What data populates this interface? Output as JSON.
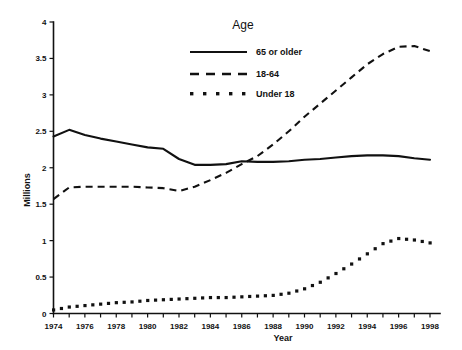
{
  "chart_data": {
    "type": "line",
    "title": "",
    "xlabel": "Year",
    "ylabel": "Millions",
    "xlim": [
      1974,
      1998
    ],
    "ylim": [
      0,
      4
    ],
    "ytick_labels": [
      "0",
      "0.5",
      "1",
      "1.5",
      "2",
      "2.5",
      "3",
      "3.5",
      "4"
    ],
    "ytick_values": [
      0,
      0.5,
      1,
      1.5,
      2,
      2.5,
      3,
      3.5,
      4
    ],
    "xtick_labels": [
      "1974",
      "1976",
      "1978",
      "1980",
      "1982",
      "1984",
      "1986",
      "1988",
      "1990",
      "1992",
      "1994",
      "1996",
      "1998"
    ],
    "xtick_values": [
      1974,
      1976,
      1978,
      1980,
      1982,
      1984,
      1986,
      1988,
      1990,
      1992,
      1994,
      1996,
      1998
    ],
    "grid": false,
    "legend_position": "top-center",
    "legend_title": "Age",
    "x": [
      1974,
      1975,
      1976,
      1977,
      1978,
      1979,
      1980,
      1981,
      1982,
      1983,
      1984,
      1985,
      1986,
      1987,
      1988,
      1989,
      1990,
      1991,
      1992,
      1993,
      1994,
      1995,
      1996,
      1997,
      1998
    ],
    "series": [
      {
        "name": "65 or older",
        "style": "solid",
        "values": [
          2.43,
          2.52,
          2.45,
          2.4,
          2.36,
          2.32,
          2.28,
          2.26,
          2.12,
          2.04,
          2.04,
          2.05,
          2.09,
          2.08,
          2.08,
          2.09,
          2.11,
          2.12,
          2.14,
          2.16,
          2.17,
          2.17,
          2.16,
          2.13,
          2.11
        ]
      },
      {
        "name": "18-64",
        "style": "dashed",
        "values": [
          1.57,
          1.73,
          1.74,
          1.74,
          1.74,
          1.74,
          1.73,
          1.72,
          1.68,
          1.74,
          1.83,
          1.93,
          2.05,
          2.16,
          2.32,
          2.5,
          2.7,
          2.88,
          3.06,
          3.24,
          3.42,
          3.56,
          3.66,
          3.67,
          3.6
        ]
      },
      {
        "name": "Under 18",
        "style": "dotted",
        "values": [
          0.05,
          0.09,
          0.11,
          0.13,
          0.15,
          0.16,
          0.18,
          0.19,
          0.2,
          0.21,
          0.22,
          0.22,
          0.23,
          0.24,
          0.25,
          0.28,
          0.34,
          0.43,
          0.55,
          0.68,
          0.82,
          0.96,
          1.03,
          1.01,
          0.97
        ]
      }
    ]
  },
  "legend": {
    "title": "Age",
    "items": [
      {
        "label": "65 or older",
        "style": "solid"
      },
      {
        "label": "18-64",
        "style": "dashed"
      },
      {
        "label": "Under 18",
        "style": "dotted"
      }
    ]
  },
  "axes": {
    "x_title": "Year",
    "y_title": "Millions"
  }
}
